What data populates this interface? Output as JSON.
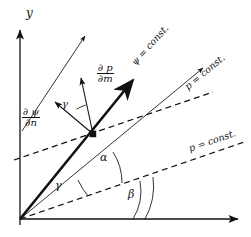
{
  "figure": {
    "type": "vector-diagram",
    "background": "#ffffff",
    "ink_color": "#111111",
    "width": 251,
    "height": 237
  },
  "axes": {
    "y_label": "y",
    "x_label": "",
    "origin": {
      "x": 20,
      "y": 219
    },
    "y_axis_top": {
      "x": 20,
      "y": 28
    },
    "x_axis_right": {
      "x": 240,
      "y": 219
    }
  },
  "node": {
    "name": "point-marker",
    "x": 93,
    "y": 134
  },
  "labels": {
    "psi_const": "ψ = const.",
    "p_const_upper": "p = const.",
    "p_const_lower": "p = const.",
    "dp_dm_num": "∂ p",
    "dp_dm_den": "∂m",
    "dpsi_dn_num": "∂ ψ",
    "dpsi_dn_den": "∂n",
    "angle_alpha": "α",
    "angle_beta": "β",
    "angle_gamma_origin": "γ",
    "angle_gamma_node": "γ"
  },
  "elements": {
    "y_axis": "y-axis-arrow",
    "x_axis": "x-axis-arrow",
    "psi_line": "thick-psi-const-streamline",
    "dashed_upper": "dashed-p-const-line-upper",
    "dashed_lower": "dashed-p-const-line-lower",
    "thin_arrow_left": "thin-gradient-line-left",
    "thin_arrow_right": "thin-gradient-line-right",
    "vector_dp_dm": "vector-dp-dm",
    "vector_dpsi_dn": "vector-dpsi-dn",
    "arc_alpha": "arc-alpha",
    "arc_beta": "arc-beta",
    "arc_gamma_origin": "arc-gamma-origin",
    "arc_gamma_node": "arc-gamma-node"
  }
}
